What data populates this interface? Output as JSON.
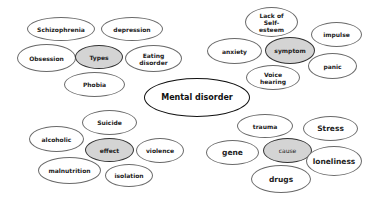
{
  "title": "Mental disorder",
  "colors": {
    "hub_fill": "#d4d4d4",
    "node_fill": "#ffffff",
    "outline": "#6a6a6a",
    "root_outline": "#111111"
  },
  "center": {
    "label": "Mental disorder"
  },
  "clusters": {
    "types": {
      "hub": "Types",
      "items": [
        "Schizophrenia",
        "depression",
        "Obsession",
        "Eating\ndisorder",
        "Phobia"
      ]
    },
    "symptom": {
      "hub": "symptom",
      "items": [
        "Lack of\nSelf-\nesteem",
        "impulse",
        "anxiety",
        "panic",
        "Voice\nhearing"
      ]
    },
    "effect": {
      "hub": "effect",
      "items": [
        "Suicide",
        "alcoholic",
        "violence",
        "malnutrition",
        "isolation"
      ]
    },
    "cause": {
      "hub": "cause",
      "items": [
        "trauma",
        "Stress",
        "gene",
        "loneliness",
        "drugs"
      ]
    }
  }
}
